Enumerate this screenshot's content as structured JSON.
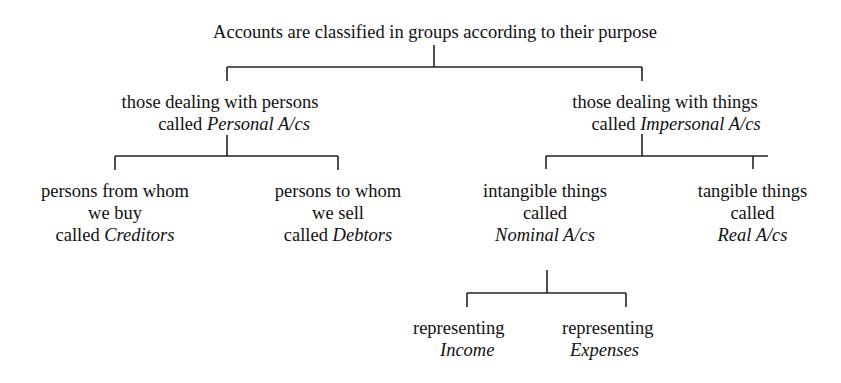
{
  "diagram": {
    "type": "tree",
    "root": {
      "text": "Accounts are classified in groups according to their purpose"
    },
    "personal": {
      "line1": "those dealing with persons",
      "line2_prefix": "called ",
      "line2_italic": "Personal A/cs"
    },
    "impersonal": {
      "line1": "those dealing with things",
      "line2_prefix": "called ",
      "line2_italic": "Impersonal A/cs"
    },
    "creditors": {
      "line1": "persons from whom",
      "line2": "we buy",
      "line3_prefix": "called ",
      "line3_italic": "Creditors"
    },
    "debtors": {
      "line1": "persons to whom",
      "line2": "we sell",
      "line3_prefix": "called ",
      "line3_italic": "Debtors"
    },
    "nominal": {
      "line1": "intangible things",
      "line2": "called",
      "line3_italic": "Nominal A/cs"
    },
    "real": {
      "line1": "tangible things",
      "line2": "called",
      "line3_italic": "Real A/cs"
    },
    "income": {
      "line1": "representing",
      "line2_italic": "Income"
    },
    "expenses": {
      "line1": "representing",
      "line2_italic": "Expenses"
    }
  }
}
